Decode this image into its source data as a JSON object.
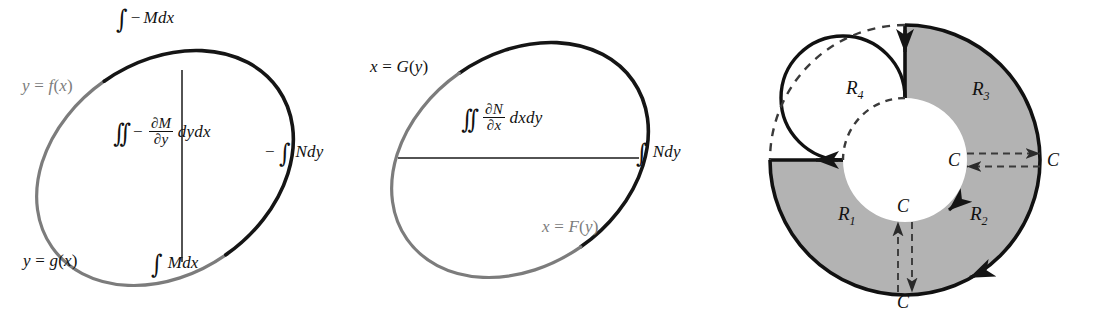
{
  "figure": {
    "panel_count": 3,
    "colors": {
      "ink": "#111111",
      "gray_curve": "#7c7c7c",
      "shade_fill": "#b3b3b3",
      "background": "#ffffff"
    }
  },
  "panel1": {
    "name": "M-component ellipse",
    "top_label": "∫ − Mdx",
    "bottom_label": "∫ Mdx",
    "upper_curve_label": "y = f(x)",
    "lower_curve_label": "y = g(x)",
    "double_integral": {
      "symbol": "∬",
      "minus": "−",
      "numerator": "∂M",
      "denominator": "∂y",
      "differential": "dydx"
    }
  },
  "panel2": {
    "name": "N-component ellipse",
    "left_label": "−∫ Ndy",
    "right_label": "∫ Ndy",
    "upper_curve_label": "x = G(y)",
    "lower_curve_label": "x = F(y)",
    "double_integral": {
      "symbol": "∬",
      "numerator": "∂N",
      "denominator": "∂x",
      "differential": "dxdy"
    }
  },
  "panel3": {
    "name": "annulus decomposition",
    "regions": [
      {
        "id": "R1",
        "letter": "R",
        "sub": "1",
        "shaded": true
      },
      {
        "id": "R2",
        "letter": "R",
        "sub": "2",
        "shaded": true
      },
      {
        "id": "R3",
        "letter": "R",
        "sub": "3",
        "shaded": true
      },
      {
        "id": "R4",
        "letter": "R",
        "sub": "4",
        "shaded": false
      }
    ],
    "curve_labels": [
      {
        "id": "C-inner-right",
        "text": "C"
      },
      {
        "id": "C-outer-right",
        "text": "C"
      },
      {
        "id": "C-inner-bottom",
        "text": "C"
      },
      {
        "id": "C-outer-bottom",
        "text": "C"
      }
    ]
  }
}
